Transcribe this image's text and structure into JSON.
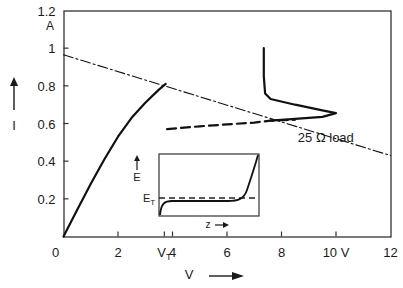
{
  "chart_data": {
    "type": "line",
    "title": "",
    "xlabel": "V",
    "ylabel": "I",
    "y_unit_label": "A",
    "x_unit_label": "V",
    "xlim": [
      0,
      12
    ],
    "ylim": [
      0,
      1.2
    ],
    "grid": false,
    "x_ticks": [
      {
        "value": 0,
        "label": "0"
      },
      {
        "value": 2,
        "label": "2"
      },
      {
        "value": 3.7,
        "label": "V_T",
        "main": "V",
        "sub": "T"
      },
      {
        "value": 4,
        "label": "4"
      },
      {
        "value": 6,
        "label": "6"
      },
      {
        "value": 8,
        "label": "8"
      },
      {
        "value": 10,
        "label": "10 V"
      },
      {
        "value": 12,
        "label": "12"
      }
    ],
    "y_ticks": [
      {
        "value": 0.2,
        "label": "0.2"
      },
      {
        "value": 0.4,
        "label": "0.4"
      },
      {
        "value": 0.6,
        "label": "0.6"
      },
      {
        "value": 0.8,
        "label": "0.8"
      },
      {
        "value": 1.0,
        "label": "1"
      },
      {
        "value": 1.2,
        "label": "1.2"
      }
    ],
    "series": [
      {
        "name": "I-V characteristic (rising branch)",
        "style": "solid",
        "points": [
          [
            0,
            0
          ],
          [
            0.5,
            0.14
          ],
          [
            1,
            0.28
          ],
          [
            1.5,
            0.41
          ],
          [
            2,
            0.53
          ],
          [
            2.5,
            0.63
          ],
          [
            3,
            0.71
          ],
          [
            3.5,
            0.78
          ],
          [
            3.75,
            0.81
          ]
        ]
      },
      {
        "name": "unstable region",
        "style": "dashed",
        "points": [
          [
            3.8,
            0.57
          ],
          [
            5,
            0.585
          ],
          [
            6,
            0.595
          ],
          [
            7,
            0.605
          ],
          [
            7.6,
            0.615
          ],
          [
            8.5,
            0.62
          ]
        ]
      },
      {
        "name": "I-V characteristic (negative differential region)",
        "style": "solid",
        "points": [
          [
            7.6,
            0.615
          ],
          [
            8.5,
            0.625
          ],
          [
            9.5,
            0.635
          ],
          [
            10.0,
            0.655
          ],
          [
            9.5,
            0.67
          ],
          [
            8.5,
            0.7
          ],
          [
            7.6,
            0.73
          ],
          [
            7.4,
            0.76
          ],
          [
            7.35,
            0.85
          ],
          [
            7.35,
            1.0
          ]
        ]
      },
      {
        "name": "25 Ω load line",
        "style": "dash-dot",
        "points": [
          [
            0,
            0.965
          ],
          [
            12,
            0.43
          ]
        ]
      }
    ],
    "annotations": [
      {
        "text": "25 Ω load",
        "x": 8.6,
        "y": 0.5
      }
    ],
    "inset": {
      "xlabel": "z",
      "ylabel": "E",
      "threshold_label": "E_T",
      "threshold_main": "E",
      "threshold_sub": "T",
      "description": "Electric field E vs position z; flat below threshold E_T (dashed) then rising steeply near the anode"
    }
  }
}
